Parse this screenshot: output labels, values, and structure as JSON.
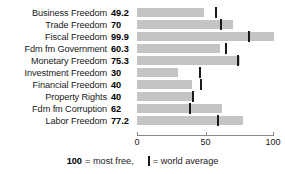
{
  "chart_data": {
    "type": "bar",
    "orientation": "horizontal",
    "title": "",
    "xlabel": "",
    "ylabel": "",
    "xlim": [
      0,
      100
    ],
    "grid": false,
    "axis_ticks": [
      {
        "value": 0,
        "label": "0"
      },
      {
        "value": 50,
        "label": "50"
      },
      {
        "value": 100,
        "label": "100"
      }
    ],
    "categories": [
      "Business Freedom",
      "Trade Freedom",
      "Fiscal Freedom",
      "Fdm fm Government",
      "Monetary Freedom",
      "Investment Freedom",
      "Financial Freedom",
      "Property Rights",
      "Fdm fm Corruption",
      "Labor Freedom"
    ],
    "values": [
      49.2,
      70,
      99.9,
      60.3,
      75.3,
      30,
      40,
      40,
      62,
      77.2
    ],
    "value_labels": [
      "49.2",
      "70",
      "99.9",
      "60.3",
      "75.3",
      "30",
      "40",
      "40",
      "62",
      "77.2"
    ],
    "world_average": [
      57.5,
      61.5,
      82.0,
      65.0,
      74.0,
      46.0,
      47.0,
      41.0,
      39.0,
      59.0
    ],
    "series": [
      {
        "name": "score",
        "values": [
          49.2,
          70,
          99.9,
          60.3,
          75.3,
          30,
          40,
          40,
          62,
          77.2
        ]
      },
      {
        "name": "world average",
        "values": [
          57.5,
          61.5,
          82.0,
          65.0,
          74.0,
          46.0,
          47.0,
          41.0,
          39.0,
          59.0
        ]
      }
    ],
    "bar_color": "#c4c4c4",
    "marker_color": "#1a1a1a"
  },
  "rows": [
    {
      "label": "Business Freedom",
      "value_label": "49.2",
      "value": 49.2,
      "avg": 57.5
    },
    {
      "label": "Trade Freedom",
      "value_label": "70",
      "value": 70,
      "avg": 61.5
    },
    {
      "label": "Fiscal Freedom",
      "value_label": "99.9",
      "value": 99.9,
      "avg": 82.0
    },
    {
      "label": "Fdm fm Government",
      "value_label": "60.3",
      "value": 60.3,
      "avg": 65.0
    },
    {
      "label": "Monetary Freedom",
      "value_label": "75.3",
      "value": 75.3,
      "avg": 74.0
    },
    {
      "label": "Investment Freedom",
      "value_label": "30",
      "value": 30,
      "avg": 46.0
    },
    {
      "label": "Financial Freedom",
      "value_label": "40",
      "value": 40,
      "avg": 47.0
    },
    {
      "label": "Property Rights",
      "value_label": "40",
      "value": 40,
      "avg": 41.0
    },
    {
      "label": "Fdm fm Corruption",
      "value_label": "62",
      "value": 62,
      "avg": 39.0
    },
    {
      "label": "Labor Freedom",
      "value_label": "77.2",
      "value": 77.2,
      "avg": 59.0
    }
  ],
  "axis": {
    "ticks": [
      {
        "value": 0,
        "label": "0"
      },
      {
        "value": 50,
        "label": "50"
      },
      {
        "value": 100,
        "label": "100"
      }
    ]
  },
  "legend": {
    "max_value": "100",
    "max_text": "= most free,",
    "marker_text": "= world average"
  }
}
